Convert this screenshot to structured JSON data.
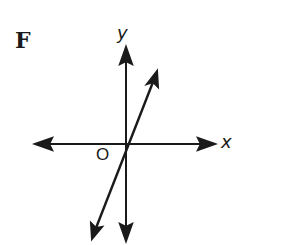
{
  "option_letter": "F",
  "axes": {
    "x_label": "x",
    "y_label": "y",
    "origin_label": "O"
  },
  "line": {
    "description": "line through origin with positive slope",
    "slope_sign": "positive",
    "passes_through_origin": true
  },
  "colors": {
    "ink": "#1a1a1a",
    "background": "#ffffff"
  }
}
